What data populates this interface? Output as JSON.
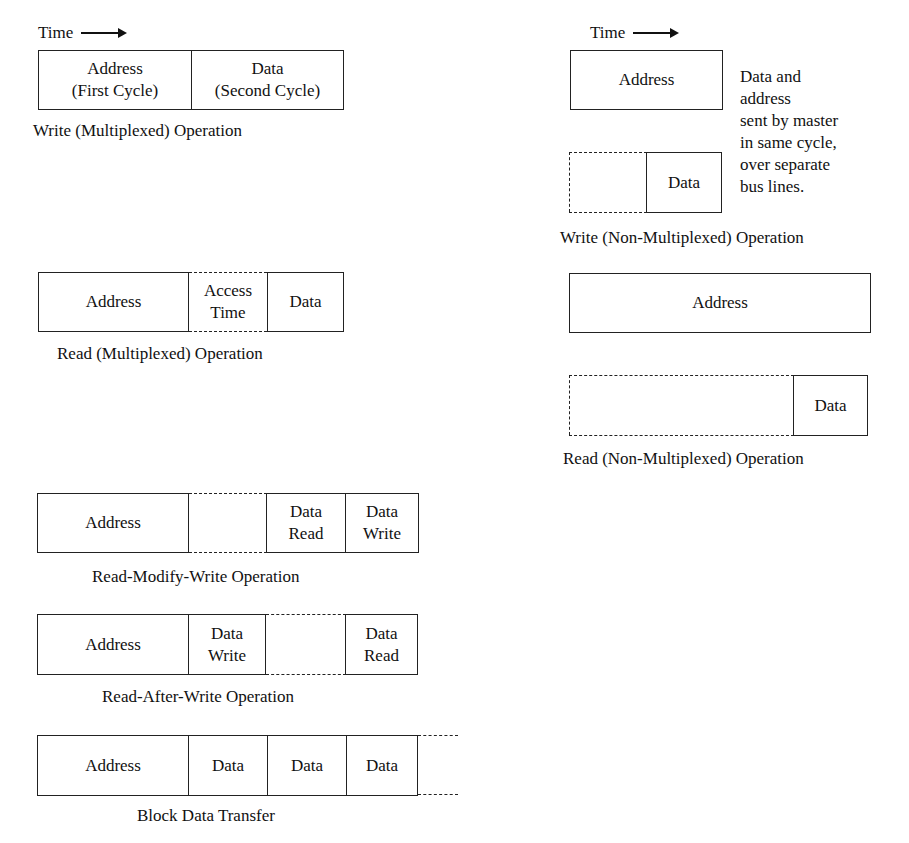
{
  "diagram": {
    "time_label": "Time",
    "write_mux": {
      "cells": [
        {
          "label": "Address",
          "sub": "(First Cycle)"
        },
        {
          "label": "Data",
          "sub": "(Second Cycle)"
        }
      ],
      "caption": "Write (Multiplexed) Operation"
    },
    "write_nonmux": {
      "address": "Address",
      "data": "Data",
      "note": [
        "Data and",
        "address",
        "sent by master",
        "in same cycle,",
        "over separate",
        "bus lines."
      ],
      "caption": "Write (Non-Multiplexed) Operation"
    },
    "read_mux": {
      "address": "Address",
      "access": [
        "Access",
        "Time"
      ],
      "data": "Data",
      "caption": "Read (Multiplexed) Operation"
    },
    "read_nonmux": {
      "address": "Address",
      "data": "Data",
      "caption": "Read (Non-Multiplexed) Operation"
    },
    "rmw": {
      "address": "Address",
      "data_read": [
        "Data",
        "Read"
      ],
      "data_write": [
        "Data",
        "Write"
      ],
      "caption": "Read-Modify-Write Operation"
    },
    "raw": {
      "address": "Address",
      "data_write": [
        "Data",
        "Write"
      ],
      "data_read": [
        "Data",
        "Read"
      ],
      "caption": "Read-After-Write Operation"
    },
    "block": {
      "address": "Address",
      "data": [
        "Data",
        "Data",
        "Data"
      ],
      "caption": "Block Data Transfer"
    }
  }
}
